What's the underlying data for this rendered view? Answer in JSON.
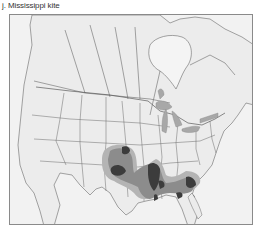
{
  "figure": {
    "title": "j. Mississippi kite"
  },
  "map": {
    "subject": "Mississippi kite range",
    "region": "North America",
    "colors": {
      "land": "#ececec",
      "water": "#f4f4f4",
      "borders": "#6e6e6e",
      "lakes": "#a8a8a8",
      "range_light": "#b4b4b4",
      "range_mid": "#8c8c8c",
      "range_dark": "#3c3c3c"
    }
  }
}
